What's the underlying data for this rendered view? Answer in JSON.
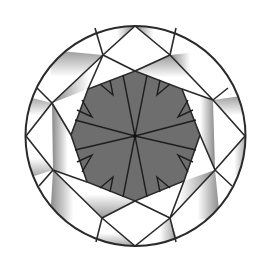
{
  "diagram": {
    "title": "Round brilliant cut diamond, top view (facet diagram)",
    "colors": {
      "background": "#ffffff",
      "table_fill": "#6e6e6e",
      "facet_fill": "#ffffff",
      "facet_shade": "#8a8a8a",
      "line": "#2a2a2a"
    },
    "girdle": {
      "cx": 135.5,
      "cy": 136,
      "r": 110
    },
    "table_vertices": [
      [
        135,
        71
      ],
      [
        182,
        89
      ],
      [
        200,
        135
      ],
      [
        184,
        181
      ],
      [
        135,
        201
      ],
      [
        87,
        182
      ],
      [
        71,
        135
      ],
      [
        88,
        89
      ]
    ],
    "center": [
      135,
      136
    ],
    "labels": []
  }
}
